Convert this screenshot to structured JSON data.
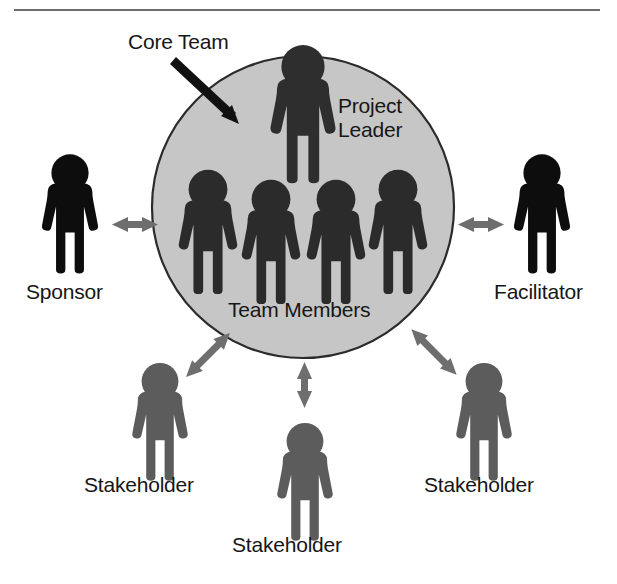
{
  "figure": {
    "kind": "project-team-structure-diagram",
    "background_color": "#ffffff",
    "rule_color": "#6c6c6c"
  },
  "core_team": {
    "callout_label": "Core Team",
    "circle_fill": "#c6c6c6",
    "circle_stroke": "#2b2b2b",
    "circle": {
      "cx": 303,
      "cy": 207,
      "r": 151
    },
    "leader": {
      "label": "Project Leader",
      "label_line_1": "Project",
      "label_line_2": "Leader",
      "color": "#2e2e2e"
    },
    "members": {
      "label": "Team Members",
      "count": 4,
      "color": "#2b2b2b"
    }
  },
  "externals": [
    {
      "name": "sponsor",
      "label": "Sponsor",
      "color": "#0d0d0d",
      "arrow": "double-headed-horizontal"
    },
    {
      "name": "facilitator",
      "label": "Facilitator",
      "color": "#0d0d0d",
      "arrow": "double-headed-horizontal"
    },
    {
      "name": "stakeholder-left",
      "label": "Stakeholder",
      "color": "#5c5c5c",
      "arrow": "double-headed-diagonal"
    },
    {
      "name": "stakeholder-center",
      "label": "Stakeholder",
      "color": "#5c5c5c",
      "arrow": "double-headed-vertical"
    },
    {
      "name": "stakeholder-right",
      "label": "Stakeholder",
      "color": "#5c5c5c",
      "arrow": "double-headed-diagonal"
    }
  ],
  "arrow_color": "#6e6e6e",
  "callout_arrow_color": "#111111"
}
